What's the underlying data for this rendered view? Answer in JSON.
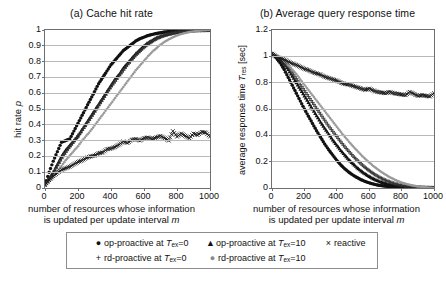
{
  "figure": {
    "panels": [
      {
        "id": "a",
        "title": "(a) Cache hit rate",
        "y_axis_caption": "hit rate p",
        "x_caption_line1": "number of resources  whose information",
        "x_caption_line2": "is updated per update interval m",
        "y_ticks": [
          "0",
          "0.1",
          "0.2",
          "0.3",
          "0.4",
          "0.5",
          "0.6",
          "0.7",
          "0.8",
          "0.9",
          "1"
        ],
        "x_ticks": [
          "0",
          "200",
          "400",
          "600",
          "800",
          "1000"
        ]
      },
      {
        "id": "b",
        "title": "(b) Average query response time",
        "y_axis_caption": "average response time T_res [sec]",
        "x_caption_line1": "number of resources  whose information",
        "x_caption_line2": "is updated per update interval m",
        "y_ticks": [
          "0",
          "0.2",
          "0.4",
          "0.6",
          "0.8",
          "1",
          "1.2"
        ],
        "x_ticks": [
          "0",
          "200",
          "400",
          "600",
          "800",
          "1000"
        ]
      }
    ],
    "legend": {
      "rows": [
        [
          {
            "marker": "filled-circle",
            "label_pre": "op-proactive at ",
            "sym": "T",
            "sub": "ex",
            "label_post": "=0"
          },
          {
            "marker": "filled-triangle",
            "label_pre": "op-proactive at ",
            "sym": "T",
            "sub": "ex",
            "label_post": "=10"
          },
          {
            "marker": "cross-x",
            "label_pre": "reactive",
            "sym": "",
            "sub": "",
            "label_post": ""
          }
        ],
        [
          {
            "marker": "plus",
            "label_pre": "rd-proactive at ",
            "sym": "T",
            "sub": "ex",
            "label_post": "=0"
          },
          {
            "marker": "small-dot",
            "label_pre": "rd-proactive at ",
            "sym": "T",
            "sub": "ex",
            "label_post": "=10"
          }
        ]
      ]
    }
  },
  "chart_data": [
    {
      "type": "scatter",
      "id": "a",
      "title": "(a) Cache hit rate",
      "xlabel": "number of resources whose information is updated per update interval m",
      "ylabel": "hit rate p",
      "xlim": [
        0,
        1000
      ],
      "ylim": [
        0,
        1
      ],
      "grid": true,
      "legend_position": "below-figure",
      "x": [
        0,
        25,
        50,
        75,
        100,
        125,
        150,
        175,
        200,
        225,
        250,
        275,
        300,
        325,
        350,
        375,
        400,
        425,
        450,
        475,
        500,
        525,
        550,
        575,
        600,
        625,
        650,
        675,
        700,
        725,
        750,
        775,
        800,
        825,
        850,
        875,
        900,
        925,
        950,
        975,
        1000
      ],
      "series": [
        {
          "name": "op-proactive at Tex=0",
          "marker": "filled-circle",
          "color": "#111111",
          "values": [
            0.02,
            0.1,
            0.17,
            0.23,
            0.29,
            0.3,
            0.31,
            0.36,
            0.41,
            0.46,
            0.51,
            0.56,
            0.61,
            0.66,
            0.7,
            0.74,
            0.78,
            0.81,
            0.84,
            0.87,
            0.89,
            0.91,
            0.93,
            0.945,
            0.955,
            0.965,
            0.972,
            0.978,
            0.983,
            0.987,
            0.99,
            0.992,
            0.994,
            0.995,
            0.996,
            0.997,
            0.998,
            0.998,
            0.999,
            0.999,
            1.0
          ]
        },
        {
          "name": "op-proactive at Tex=10",
          "marker": "filled-triangle",
          "color": "#111111",
          "values": [
            0.02,
            0.06,
            0.1,
            0.15,
            0.2,
            0.24,
            0.27,
            0.3,
            0.33,
            0.37,
            0.41,
            0.45,
            0.49,
            0.53,
            0.57,
            0.61,
            0.65,
            0.69,
            0.72,
            0.76,
            0.79,
            0.82,
            0.85,
            0.875,
            0.9,
            0.92,
            0.935,
            0.95,
            0.96,
            0.968,
            0.975,
            0.981,
            0.986,
            0.99,
            0.993,
            0.995,
            0.996,
            0.998,
            0.999,
            0.999,
            1.0
          ]
        },
        {
          "name": "rd-proactive at Tex=0",
          "marker": "plus",
          "color": "#333333",
          "values": [
            0.02,
            0.055,
            0.095,
            0.14,
            0.185,
            0.225,
            0.26,
            0.295,
            0.33,
            0.365,
            0.4,
            0.44,
            0.48,
            0.52,
            0.56,
            0.6,
            0.64,
            0.675,
            0.71,
            0.745,
            0.78,
            0.81,
            0.84,
            0.865,
            0.89,
            0.91,
            0.928,
            0.944,
            0.956,
            0.966,
            0.974,
            0.98,
            0.985,
            0.989,
            0.992,
            0.994,
            0.996,
            0.997,
            0.998,
            0.999,
            1.0
          ]
        },
        {
          "name": "rd-proactive at Tex=10",
          "marker": "small-dot",
          "color": "#999999",
          "values": [
            0.015,
            0.04,
            0.07,
            0.105,
            0.14,
            0.175,
            0.205,
            0.235,
            0.265,
            0.3,
            0.33,
            0.36,
            0.395,
            0.43,
            0.465,
            0.5,
            0.535,
            0.57,
            0.605,
            0.64,
            0.675,
            0.71,
            0.745,
            0.775,
            0.805,
            0.835,
            0.862,
            0.885,
            0.907,
            0.925,
            0.941,
            0.954,
            0.965,
            0.974,
            0.981,
            0.987,
            0.991,
            0.995,
            0.997,
            0.999,
            1.0
          ]
        },
        {
          "name": "reactive",
          "marker": "cross-x",
          "color": "#111111",
          "values": [
            0.02,
            0.05,
            0.075,
            0.095,
            0.115,
            0.125,
            0.135,
            0.15,
            0.165,
            0.175,
            0.19,
            0.2,
            0.205,
            0.22,
            0.225,
            0.245,
            0.25,
            0.26,
            0.275,
            0.295,
            0.285,
            0.305,
            0.31,
            0.3,
            0.315,
            0.32,
            0.31,
            0.32,
            0.33,
            0.315,
            0.3,
            0.36,
            0.325,
            0.345,
            0.33,
            0.315,
            0.345,
            0.335,
            0.355,
            0.35,
            0.325
          ]
        }
      ]
    },
    {
      "type": "scatter",
      "id": "b",
      "title": "(b) Average query response time",
      "xlabel": "number of resources whose information is updated per update interval m",
      "ylabel": "average response time T_res [sec]",
      "xlim": [
        0,
        1000
      ],
      "ylim": [
        0,
        1.2
      ],
      "grid": true,
      "legend_position": "below-figure",
      "x": [
        0,
        25,
        50,
        75,
        100,
        125,
        150,
        175,
        200,
        225,
        250,
        275,
        300,
        325,
        350,
        375,
        400,
        425,
        450,
        475,
        500,
        525,
        550,
        575,
        600,
        625,
        650,
        675,
        700,
        725,
        750,
        775,
        800,
        825,
        850,
        875,
        900,
        925,
        950,
        975,
        1000
      ],
      "series": [
        {
          "name": "op-proactive at Tex=0",
          "marker": "filled-circle",
          "color": "#111111",
          "values": [
            1.02,
            0.99,
            0.95,
            0.9,
            0.84,
            0.78,
            0.72,
            0.66,
            0.6,
            0.545,
            0.49,
            0.435,
            0.385,
            0.335,
            0.29,
            0.25,
            0.21,
            0.175,
            0.145,
            0.12,
            0.098,
            0.08,
            0.063,
            0.05,
            0.039,
            0.03,
            0.023,
            0.018,
            0.014,
            0.011,
            0.0085,
            0.0065,
            0.005,
            0.004,
            0.003,
            0.0025,
            0.002,
            0.0015,
            0.001,
            0.0005,
            0.0
          ]
        },
        {
          "name": "op-proactive at Tex=10",
          "marker": "filled-triangle",
          "color": "#111111",
          "values": [
            1.02,
            1.0,
            0.975,
            0.94,
            0.9,
            0.85,
            0.8,
            0.75,
            0.7,
            0.65,
            0.6,
            0.55,
            0.5,
            0.455,
            0.41,
            0.365,
            0.325,
            0.285,
            0.25,
            0.215,
            0.185,
            0.155,
            0.13,
            0.108,
            0.088,
            0.071,
            0.057,
            0.045,
            0.035,
            0.027,
            0.021,
            0.016,
            0.012,
            0.009,
            0.007,
            0.005,
            0.0035,
            0.0025,
            0.0015,
            0.0008,
            0.0
          ]
        },
        {
          "name": "rd-proactive at Tex=0",
          "marker": "plus",
          "color": "#333333",
          "values": [
            1.02,
            1.0,
            0.98,
            0.95,
            0.915,
            0.875,
            0.83,
            0.785,
            0.74,
            0.695,
            0.65,
            0.605,
            0.56,
            0.515,
            0.47,
            0.43,
            0.39,
            0.35,
            0.312,
            0.277,
            0.243,
            0.212,
            0.183,
            0.156,
            0.132,
            0.11,
            0.091,
            0.074,
            0.059,
            0.047,
            0.036,
            0.028,
            0.021,
            0.016,
            0.012,
            0.0085,
            0.006,
            0.004,
            0.0025,
            0.001,
            0.0
          ]
        },
        {
          "name": "rd-proactive at Tex=10",
          "marker": "small-dot",
          "color": "#999999",
          "values": [
            1.02,
            1.005,
            0.99,
            0.965,
            0.935,
            0.9,
            0.865,
            0.825,
            0.785,
            0.745,
            0.705,
            0.665,
            0.625,
            0.585,
            0.545,
            0.505,
            0.465,
            0.425,
            0.388,
            0.352,
            0.317,
            0.284,
            0.252,
            0.222,
            0.194,
            0.168,
            0.144,
            0.122,
            0.102,
            0.084,
            0.068,
            0.054,
            0.042,
            0.032,
            0.024,
            0.017,
            0.012,
            0.008,
            0.005,
            0.002,
            0.0
          ]
        },
        {
          "name": "reactive",
          "marker": "cross-x",
          "color": "#111111",
          "values": [
            1.02,
            1.0,
            0.985,
            0.975,
            0.96,
            0.945,
            0.935,
            0.92,
            0.905,
            0.895,
            0.88,
            0.87,
            0.86,
            0.845,
            0.835,
            0.825,
            0.815,
            0.8,
            0.79,
            0.785,
            0.775,
            0.765,
            0.755,
            0.745,
            0.755,
            0.74,
            0.73,
            0.725,
            0.72,
            0.73,
            0.72,
            0.715,
            0.71,
            0.705,
            0.73,
            0.715,
            0.7,
            0.705,
            0.7,
            0.695,
            0.72
          ]
        }
      ]
    }
  ]
}
